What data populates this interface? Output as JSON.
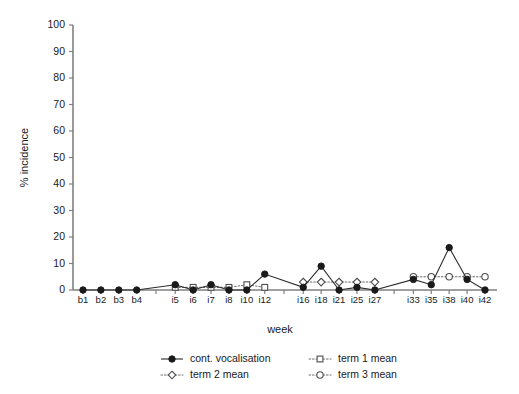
{
  "chart_data": {
    "type": "line",
    "title": "",
    "xlabel": "week",
    "ylabel": "% incidence",
    "ylim": [
      0,
      100
    ],
    "yticks": [
      0,
      10,
      20,
      30,
      40,
      50,
      60,
      70,
      80,
      90,
      100
    ],
    "ytick_labels": [
      "0",
      "10",
      "20",
      "30",
      "40",
      "50",
      "60",
      "70",
      "80",
      "90",
      "100"
    ],
    "grid": false,
    "legend_position": "bottom",
    "categories": [
      "b1",
      "b2",
      "b3",
      "b4",
      "i5",
      "i6",
      "i7",
      "i8",
      "i10",
      "i12",
      "i16",
      "i18",
      "i21",
      "i25",
      "i27",
      "i33",
      "i35",
      "i38",
      "i40",
      "i42"
    ],
    "group_breaks": [
      "b4|i5",
      "i12|i16",
      "i27|i33"
    ],
    "series": [
      {
        "name": "cont. vocalisation",
        "marker": "filled-circle",
        "line": "solid",
        "color": "#1a1a1a",
        "values": [
          0,
          0,
          0,
          0,
          2,
          0,
          2,
          0,
          0,
          6,
          1,
          9,
          0,
          1,
          0,
          4,
          2,
          16,
          4,
          0
        ]
      },
      {
        "name": "term 1 mean",
        "marker": "open-square",
        "line": "dotted",
        "color": "#4d4d4d",
        "values": [
          null,
          null,
          null,
          null,
          1,
          1,
          1,
          1,
          2,
          1,
          null,
          null,
          null,
          null,
          null,
          null,
          null,
          null,
          null,
          null
        ]
      },
      {
        "name": "term 2 mean",
        "marker": "open-diamond",
        "line": "dotted",
        "color": "#4d4d4d",
        "values": [
          null,
          null,
          null,
          null,
          null,
          null,
          null,
          null,
          null,
          null,
          3,
          3,
          3,
          3,
          3,
          null,
          null,
          null,
          null,
          null
        ]
      },
      {
        "name": "term 3 mean",
        "marker": "open-circle",
        "line": "dotted",
        "color": "#4d4d4d",
        "values": [
          null,
          null,
          null,
          null,
          null,
          null,
          null,
          null,
          null,
          null,
          null,
          null,
          null,
          null,
          null,
          5,
          5,
          5,
          5,
          5
        ]
      }
    ],
    "legend_entries": [
      {
        "label": "cont. vocalisation",
        "marker": "filled-circle",
        "line": "solid"
      },
      {
        "label": "term 1 mean",
        "marker": "open-square",
        "line": "dotted"
      },
      {
        "label": "term 2 mean",
        "marker": "open-diamond",
        "line": "dotted"
      },
      {
        "label": "term 3 mean",
        "marker": "open-circle",
        "line": "dotted"
      }
    ]
  }
}
